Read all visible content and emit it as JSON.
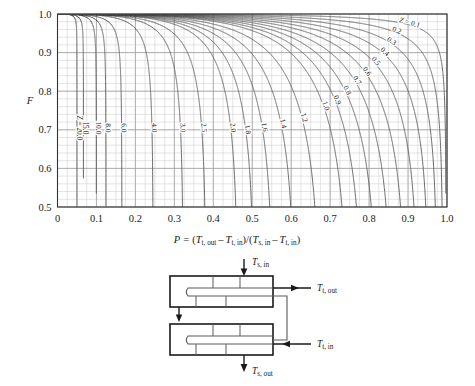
{
  "chart_data": {
    "type": "line",
    "title": "",
    "xlabel": "P = (T_t,out - T_t,in)/(T_s,in - T_t,in)",
    "ylabel": "F",
    "xlim": [
      0,
      1.0
    ],
    "ylim": [
      0.5,
      1.0
    ],
    "grid": true,
    "legend_position": "inline-curve-labels",
    "x_ticks": [
      "0",
      "0.1",
      "0.2",
      "0.3",
      "0.4",
      "0.5",
      "0.6",
      "0.7",
      "0.8",
      "0.9",
      "1.0"
    ],
    "x_tick_values": [
      0,
      0.1,
      0.2,
      0.3,
      0.4,
      0.5,
      0.6,
      0.7,
      0.8,
      0.9,
      1.0
    ],
    "y_ticks": [
      "0.5",
      "0.6",
      "0.7",
      "0.8",
      "0.9",
      "1.0"
    ],
    "y_tick_values": [
      0.5,
      0.6,
      0.7,
      0.8,
      0.9,
      1.0
    ],
    "x_minor_step": 0.025,
    "y_minor_step": 0.02,
    "parameter_name": "Z",
    "curve_family": "LMTD correction factor F for a 2-shell-pass, 4-or-more-tube-pass heat exchanger",
    "series": [
      {
        "name": "Z = 20.0",
        "z": 20.0,
        "label": "Z = 20.0"
      },
      {
        "name": "15.0",
        "z": 15.0,
        "label": "15.0"
      },
      {
        "name": "10.0",
        "z": 10.0,
        "label": "10.0"
      },
      {
        "name": "8.0",
        "z": 8.0,
        "label": "8.0"
      },
      {
        "name": "6.0",
        "z": 6.0,
        "label": "6.0"
      },
      {
        "name": "4.0",
        "z": 4.0,
        "label": "4.0"
      },
      {
        "name": "3.0",
        "z": 3.0,
        "label": "3.0"
      },
      {
        "name": "2.5",
        "z": 2.5,
        "label": "2.5"
      },
      {
        "name": "2.0",
        "z": 2.0,
        "label": "2.0"
      },
      {
        "name": "1.8",
        "z": 1.8,
        "label": "1.8"
      },
      {
        "name": "1.6",
        "z": 1.6,
        "label": "1.6"
      },
      {
        "name": "1.4",
        "z": 1.4,
        "label": "1.4"
      },
      {
        "name": "1.2",
        "z": 1.2,
        "label": "1.2"
      },
      {
        "name": "1.0",
        "z": 1.0,
        "label": "1.0"
      },
      {
        "name": "0.9",
        "z": 0.9,
        "label": "0.9"
      },
      {
        "name": "0.8",
        "z": 0.8,
        "label": "0.8"
      },
      {
        "name": "0.7",
        "z": 0.7,
        "label": "0.7"
      },
      {
        "name": "0.6",
        "z": 0.6,
        "label": "0.6"
      },
      {
        "name": "0.5",
        "z": 0.5,
        "label": "0.5"
      },
      {
        "name": "0.4",
        "z": 0.4,
        "label": "0.4"
      },
      {
        "name": "0.3",
        "z": 0.3,
        "label": "0.3"
      },
      {
        "name": "0.2",
        "z": 0.2,
        "label": "0.2"
      },
      {
        "name": "Z = 0.1",
        "z": 0.1,
        "label": "Z = 0.1"
      }
    ]
  },
  "axes": {
    "y_axis_symbol": "F",
    "x_axis_formula": {
      "lead": "P",
      "equals": "=",
      "num_open": "(",
      "num_t1_base": "T",
      "num_t1_sub": "t, out",
      "minus1": "–",
      "num_t2_base": "T",
      "num_t2_sub": "t, in",
      "num_close": ")",
      "slash": "/",
      "den_open": "(",
      "den_t1_base": "T",
      "den_t1_sub": "s, in",
      "minus2": "–",
      "den_t2_base": "T",
      "den_t2_sub": "t, in",
      "den_close": ")"
    }
  },
  "diagram": {
    "name": "two-shell-pass-heat-exchanger",
    "labels": {
      "shell_in": {
        "base": "T",
        "sub": "s, in"
      },
      "tube_out": {
        "base": "T",
        "sub": "t, out"
      },
      "tube_in": {
        "base": "T",
        "sub": "t, in"
      },
      "shell_out": {
        "base": "T",
        "sub": "s, out"
      }
    }
  },
  "colors": {
    "background": "#ffffff",
    "curve": "#5a5a5a",
    "grid": "#c9c9c9",
    "axis": "#333333",
    "text": "#1a1a1a",
    "diagram_stroke": "#1a1a1a",
    "diagram_inner": "#5a5a5a"
  }
}
